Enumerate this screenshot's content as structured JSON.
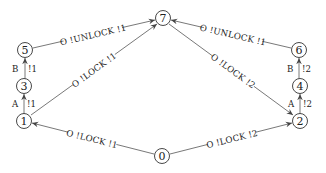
{
  "diagram": {
    "type": "state-transition-graph",
    "nodes": [
      {
        "id": "0",
        "label": "0",
        "x": 162,
        "y": 156
      },
      {
        "id": "1",
        "label": "1",
        "x": 24,
        "y": 121
      },
      {
        "id": "2",
        "label": "2",
        "x": 300,
        "y": 121
      },
      {
        "id": "3",
        "label": "3",
        "x": 24,
        "y": 86
      },
      {
        "id": "4",
        "label": "4",
        "x": 300,
        "y": 86
      },
      {
        "id": "5",
        "label": "5",
        "x": 25,
        "y": 50
      },
      {
        "id": "6",
        "label": "6",
        "x": 299,
        "y": 50
      },
      {
        "id": "7",
        "label": "7",
        "x": 163,
        "y": 18
      }
    ],
    "edges": [
      {
        "from": "5",
        "to": "7",
        "label": "O !UNLOCK !1"
      },
      {
        "from": "1",
        "to": "7",
        "label": "O !LOCK !1"
      },
      {
        "from": "6",
        "to": "7",
        "label": "O !UNLOCK !1"
      },
      {
        "from": "7",
        "to": "2",
        "label": "O !LOCK !2"
      },
      {
        "from": "3",
        "to": "5",
        "label_left": "B",
        "label_right": "!1"
      },
      {
        "from": "1",
        "to": "3",
        "label_left": "A",
        "label_right": "!1"
      },
      {
        "from": "4",
        "to": "6",
        "label_left": "B",
        "label_right": "!2"
      },
      {
        "from": "2",
        "to": "4",
        "label_left": "A",
        "label_right": "!2"
      },
      {
        "from": "0",
        "to": "1",
        "label": "O !LOCK !1"
      },
      {
        "from": "0",
        "to": "2",
        "label": "O !LOCK !2"
      }
    ]
  },
  "colors": {
    "line": "#555555",
    "text": "#222222",
    "background": "#ffffff"
  }
}
